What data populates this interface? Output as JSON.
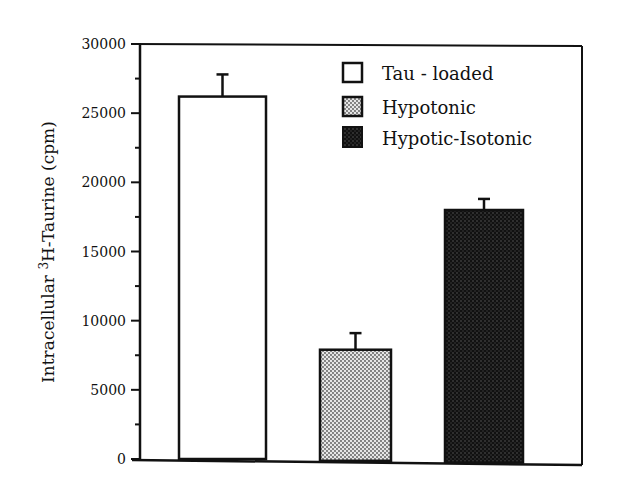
{
  "chart_data": {
    "type": "bar",
    "title": "",
    "xlabel": "",
    "ylabel": "Intracellular ³H-Taurine (cpm)",
    "ylabel_parts": {
      "before": "Intracellular ",
      "superscript": "3",
      "after": "H-Taurine (cpm)"
    },
    "ylim": [
      0,
      30000
    ],
    "yticks": [
      0,
      5000,
      10000,
      15000,
      20000,
      25000,
      30000
    ],
    "yticks_minor": [
      2500,
      7500,
      12500,
      17500,
      22500,
      27500
    ],
    "grid": false,
    "legend_position": "top-right",
    "categories": [
      "Tau - loaded",
      "Hypotonic",
      "Hypotic-Isotonic"
    ],
    "series": [
      {
        "name": "Tau - loaded",
        "value": 26200,
        "error": 1600,
        "fill": "white"
      },
      {
        "name": "Hypotonic",
        "value": 7900,
        "error": 1200,
        "fill": "light-stipple"
      },
      {
        "name": "Hypotic-Isotonic",
        "value": 18000,
        "error": 800,
        "fill": "dark-stipple"
      }
    ],
    "values": [
      26200,
      7900,
      18000
    ],
    "errors": [
      1600,
      1200,
      800
    ],
    "legend": [
      "Tau - loaded",
      "Hypotonic",
      "Hypotic-Isotonic"
    ]
  },
  "colors": {
    "ink": "#111111",
    "light_fill": "#cfcfcf",
    "dark_fill": "#1a1a1a"
  }
}
